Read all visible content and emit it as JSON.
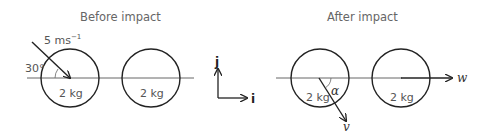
{
  "before": {
    "title": "Before impact",
    "speed_label": "5 ms",
    "speed_exp": "−1",
    "angle_label": "30°",
    "ball1_mass": "2 kg",
    "ball2_mass": "2 kg"
  },
  "axes": {
    "j_label": "j",
    "i_label": "i"
  },
  "after": {
    "title": "After impact",
    "angle_label": "α",
    "ball1_mass": "2 kg",
    "ball2_mass": "2 kg",
    "v_label": "v",
    "w_label": "w"
  }
}
